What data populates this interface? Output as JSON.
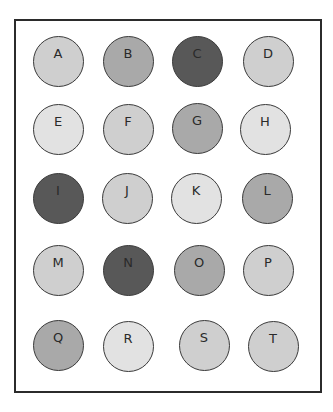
{
  "diagram": {
    "type": "grid-of-circles",
    "rows": 5,
    "columns": 4,
    "colors": {
      "lighter": "#e2e2e2",
      "light": "#cfcfcf",
      "medium": "#a9a9a9",
      "dark": "#585858",
      "border": "#2b2b2b"
    },
    "circles": [
      {
        "label": "A",
        "shade": "light",
        "cx": 58,
        "cy": 61
      },
      {
        "label": "B",
        "shade": "medium",
        "cx": 128,
        "cy": 61
      },
      {
        "label": "C",
        "shade": "dark",
        "cx": 197,
        "cy": 61
      },
      {
        "label": "D",
        "shade": "light",
        "cx": 268,
        "cy": 61
      },
      {
        "label": "E",
        "shade": "lighter",
        "cx": 58,
        "cy": 129
      },
      {
        "label": "F",
        "shade": "light",
        "cx": 128,
        "cy": 129
      },
      {
        "label": "G",
        "shade": "medium",
        "cx": 197,
        "cy": 128
      },
      {
        "label": "H",
        "shade": "lighter",
        "cx": 265,
        "cy": 129
      },
      {
        "label": "I",
        "shade": "dark",
        "cx": 58,
        "cy": 198
      },
      {
        "label": "J",
        "shade": "light",
        "cx": 127,
        "cy": 198
      },
      {
        "label": "K",
        "shade": "lighter",
        "cx": 196,
        "cy": 198
      },
      {
        "label": "L",
        "shade": "medium",
        "cx": 267,
        "cy": 198
      },
      {
        "label": "M",
        "shade": "light",
        "cx": 58,
        "cy": 270
      },
      {
        "label": "N",
        "shade": "dark",
        "cx": 128,
        "cy": 270
      },
      {
        "label": "O",
        "shade": "medium",
        "cx": 199,
        "cy": 270
      },
      {
        "label": "P",
        "shade": "light",
        "cx": 268,
        "cy": 270
      },
      {
        "label": "Q",
        "shade": "medium",
        "cx": 58,
        "cy": 345
      },
      {
        "label": "R",
        "shade": "lighter",
        "cx": 128,
        "cy": 346
      },
      {
        "label": "S",
        "shade": "light",
        "cx": 204,
        "cy": 345
      },
      {
        "label": "T",
        "shade": "light",
        "cx": 273,
        "cy": 346
      }
    ]
  }
}
